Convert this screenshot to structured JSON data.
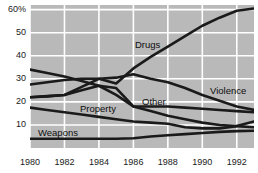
{
  "chart_data": {
    "type": "line",
    "title": "",
    "subtitle": "",
    "xlabel": "",
    "ylabel": "",
    "xlim": [
      1980,
      1993
    ],
    "ylim": [
      0,
      62
    ],
    "grid": true,
    "legend": "inline-labels",
    "x": [
      1980,
      1981,
      1982,
      1983,
      1984,
      1985,
      1986,
      1987,
      1988,
      1989,
      1990,
      1991,
      1992,
      1993
    ],
    "y_ticks": [
      10,
      20,
      30,
      40,
      50,
      60
    ],
    "y_tick_labels": [
      "10",
      "20",
      "30",
      "40",
      "50",
      "60%"
    ],
    "x_ticks": [
      1980,
      1982,
      1984,
      1986,
      1988,
      1990,
      1992
    ],
    "x_tick_labels": [
      "1980",
      "1982",
      "1984",
      "1986",
      "1988",
      "1990",
      "1992"
    ],
    "series": [
      {
        "name": "Drugs",
        "label": "Drugs",
        "color": "#1a1a1a",
        "values": [
          22.0,
          22.4,
          23.0,
          26.5,
          30.0,
          28.0,
          34.5,
          39.5,
          44.0,
          48.5,
          53.0,
          56.5,
          59.5,
          60.5
        ]
      },
      {
        "name": "Violence",
        "label": "Violence",
        "color": "#1a1a1a",
        "values": [
          27.5,
          28.5,
          29.5,
          30.0,
          30.0,
          30.5,
          32.0,
          30.0,
          28.5,
          26.0,
          23.0,
          20.5,
          18.0,
          16.5
        ]
      },
      {
        "name": "Other",
        "label": "Other",
        "color": "#1a1a1a",
        "values": [
          34.0,
          32.5,
          31.0,
          29.0,
          27.0,
          23.0,
          18.0,
          18.0,
          18.0,
          17.5,
          17.0,
          16.5,
          16.0,
          15.5
        ]
      },
      {
        "name": "Property",
        "label": "Property",
        "color": "#1a1a1a",
        "values": [
          22.0,
          22.5,
          23.0,
          25.0,
          27.0,
          26.0,
          18.0,
          16.0,
          14.0,
          12.5,
          11.0,
          10.0,
          9.5,
          9.0
        ]
      },
      {
        "name": "Weapons",
        "label": "Weapons",
        "color": "#1a1a1a",
        "values": [
          17.5,
          16.5,
          15.5,
          14.5,
          13.5,
          12.5,
          11.5,
          11.0,
          10.5,
          9.0,
          8.5,
          8.5,
          9.5,
          11.5
        ]
      },
      {
        "name": "Baseline",
        "label": "",
        "color": "#1a1a1a",
        "values": [
          4.0,
          4.0,
          4.0,
          4.0,
          4.0,
          4.0,
          4.2,
          5.0,
          5.5,
          6.0,
          6.5,
          7.0,
          7.3,
          7.5
        ]
      }
    ],
    "series_labels": [
      {
        "text": "Drugs",
        "x_px": 135,
        "y_px": 40
      },
      {
        "text": "Violence",
        "x_px": 210,
        "y_px": 86
      },
      {
        "text": "Other",
        "x_px": 142,
        "y_px": 97
      },
      {
        "text": "Property",
        "x_px": 80,
        "y_px": 104
      },
      {
        "text": "Weapons",
        "x_px": 38,
        "y_px": 128
      }
    ],
    "colors": {
      "plot_background": "#b9b9b9",
      "gridline": "#ffffff",
      "line": "#1a1a1a",
      "page_background": "#ffffff",
      "text": "#1a1a1a"
    }
  }
}
